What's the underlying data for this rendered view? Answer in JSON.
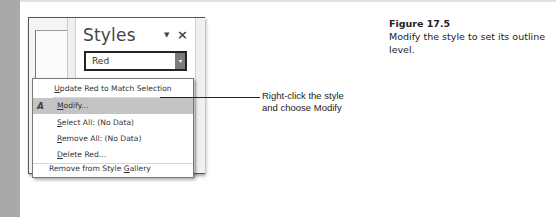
{
  "figure": {
    "number": "Figure 17.5",
    "caption": "Modify the style to set its outline level."
  },
  "callout": {
    "line1": "Right-click the style",
    "line2": "and choose Modify"
  },
  "styles_pane": {
    "title": "Styles",
    "pin_glyph": "▼",
    "close_glyph": "×",
    "selected_style": "Red",
    "dropdown_glyph": "▾",
    "subtitle_item": "Subtitle",
    "subtitle_mark": "¶a"
  },
  "context_menu": {
    "items": [
      {
        "label_pre": "U",
        "label_rest": "pdate Red to Match Selection",
        "highlighted": false
      },
      {
        "icon": "A",
        "label_pre": "M",
        "label_rest": "odify...",
        "highlighted": true
      },
      {
        "label_pre": "S",
        "label_rest": "elect All: (No Data)",
        "highlighted": false
      },
      {
        "label_pre": "R",
        "label_rest": "emove All: (No Data)",
        "highlighted": false
      },
      {
        "label_pre": "D",
        "label_rest": "elete Red...",
        "highlighted": false
      },
      {
        "label_a": "Remove from Style ",
        "label_pre": "G",
        "label_rest": "allery",
        "highlighted": false
      }
    ]
  },
  "colors": {
    "left_band": "#a9a9a9",
    "menu_highlight": "#c4c4c4",
    "dropdown_button": "#7b7b7b"
  }
}
